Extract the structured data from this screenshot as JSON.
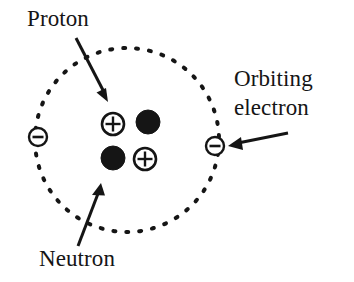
{
  "figure": {
    "kind": "atom-diagram",
    "background_color": "#ffffff",
    "ink_color": "#151515"
  },
  "labels": {
    "proton": "Proton",
    "neutron": "Neutron",
    "orbiting_electron_line1": "Orbiting",
    "orbiting_electron_line2": "electron"
  },
  "orbit": {
    "name": "electron-orbit",
    "style": "dotted",
    "center_x": 127,
    "center_y": 140,
    "radius": 92
  },
  "nucleus": {
    "particles": [
      {
        "type": "proton",
        "symbol": "+",
        "fill": "open",
        "cx": 113,
        "cy": 124,
        "r": 11
      },
      {
        "type": "neutron",
        "symbol": "",
        "fill": "solid",
        "cx": 148,
        "cy": 122,
        "r": 12
      },
      {
        "type": "neutron",
        "symbol": "",
        "fill": "solid",
        "cx": 113,
        "cy": 158,
        "r": 12
      },
      {
        "type": "proton",
        "symbol": "+",
        "fill": "open",
        "cx": 145,
        "cy": 159,
        "r": 11
      }
    ]
  },
  "electrons": [
    {
      "name": "electron-left",
      "symbol": "−",
      "cx": 38,
      "cy": 137,
      "r": 9
    },
    {
      "name": "electron-right",
      "symbol": "−",
      "cx": 215,
      "cy": 146,
      "r": 9
    }
  ],
  "arrows": [
    {
      "name": "proton-arrow",
      "from_x": 76,
      "from_y": 38,
      "to_x": 108,
      "to_y": 100
    },
    {
      "name": "neutron-arrow",
      "from_x": 78,
      "from_y": 246,
      "to_x": 101,
      "to_y": 184
    },
    {
      "name": "electron-arrow",
      "from_x": 288,
      "from_y": 133,
      "to_x": 228,
      "to_y": 146
    }
  ]
}
